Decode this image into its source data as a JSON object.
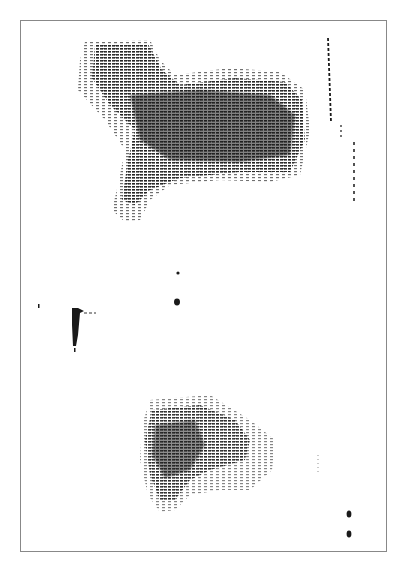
{
  "image": {
    "description": "Scanned halftone scintigraphy print with two dark blotches inside a thin rectangular frame",
    "colors": {
      "ink": "#1a1a1a",
      "paper": "#ffffff",
      "frame": "#888888"
    }
  }
}
